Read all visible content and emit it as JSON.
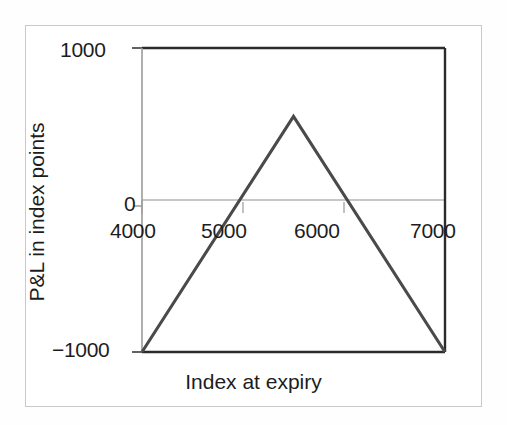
{
  "chart_data": {
    "type": "line",
    "title": "",
    "subtitle": "",
    "xlabel": "Index at expiry",
    "ylabel": "P&L in index points",
    "xlim": [
      4000,
      7000
    ],
    "ylim": [
      -1000,
      1000
    ],
    "xticks": [
      4000,
      5000,
      6000,
      7000
    ],
    "xtick_labels": [
      "4000",
      "5000",
      "6000",
      "7000"
    ],
    "yticks": [
      -1000,
      0,
      1000
    ],
    "ytick_labels": [
      "1000",
      "0",
      "−1000"
    ],
    "grid": false,
    "legend": null,
    "zero_line": 0,
    "series": [
      {
        "name": "P&L at expiry",
        "color": "#4a4a4a",
        "x": [
          4000,
          5500,
          7000
        ],
        "values": [
          -1000,
          550,
          -1000
        ],
        "breakeven_points": [
          4950,
          6050
        ],
        "peak": {
          "x": 5500,
          "y": 550
        }
      }
    ],
    "annotations": []
  },
  "axis_labels": {
    "y_top": "1000",
    "y_zero": "0",
    "y_bottom": "−1000",
    "x_1": "4000",
    "x_2": "5000",
    "x_3": "6000",
    "x_4": "7000",
    "x_title": "Index at expiry",
    "y_title": "P&L in index points"
  },
  "colors": {
    "line": "#4a4a4a",
    "axis": "#2b2b2b",
    "zero_line": "#b0b0b0",
    "tick": "#9a9a9a",
    "frame": "#c9c9c9",
    "background": "#ffffff",
    "text": "#1d1d1d"
  }
}
